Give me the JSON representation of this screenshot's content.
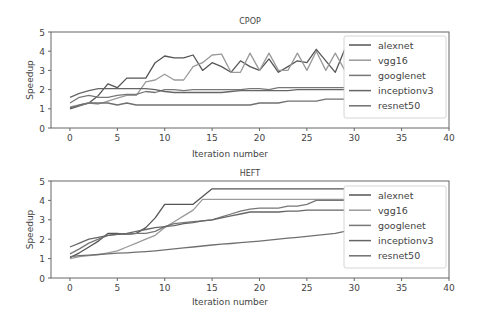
{
  "figure": {
    "width": 480,
    "height": 328
  },
  "chart_data": [
    {
      "type": "line",
      "title": "CPOP",
      "xlabel": "Iteration number",
      "ylabel": "Speedup",
      "xlim": [
        -2,
        40
      ],
      "ylim": [
        0,
        5
      ],
      "xticks": [
        0,
        5,
        10,
        15,
        20,
        25,
        30,
        35,
        40
      ],
      "yticks": [
        0,
        1,
        2,
        3,
        4,
        5
      ],
      "grid": false,
      "legend_position": "right, inside axes",
      "x": [
        0,
        1,
        2,
        3,
        4,
        5,
        6,
        7,
        8,
        9,
        10,
        11,
        12,
        13,
        14,
        15,
        16,
        17,
        18,
        19,
        20,
        21,
        22,
        23,
        24,
        25,
        26,
        27,
        28,
        29
      ],
      "series": [
        {
          "name": "alexnet",
          "color": "#555555",
          "values": [
            1.0,
            1.15,
            1.3,
            1.7,
            2.3,
            2.1,
            2.6,
            2.6,
            2.6,
            3.4,
            3.75,
            3.65,
            3.65,
            3.8,
            3.0,
            3.4,
            3.2,
            2.9,
            3.5,
            3.2,
            3.0,
            3.6,
            2.9,
            3.2,
            3.5,
            3.4,
            4.1,
            3.5,
            2.9,
            4.1
          ]
        },
        {
          "name": "vgg16",
          "color": "#9a9a9a",
          "values": [
            1.1,
            1.2,
            1.3,
            1.25,
            1.4,
            1.55,
            1.7,
            1.7,
            2.4,
            2.5,
            2.8,
            2.5,
            2.5,
            3.2,
            3.4,
            3.8,
            3.85,
            2.9,
            2.9,
            3.9,
            3.0,
            3.9,
            3.0,
            3.0,
            3.9,
            3.0,
            4.0,
            3.0,
            3.9,
            3.0
          ]
        },
        {
          "name": "googlenet",
          "color": "#777777",
          "values": [
            1.3,
            1.6,
            1.7,
            1.6,
            1.6,
            1.7,
            1.75,
            1.75,
            1.9,
            1.85,
            2.0,
            2.0,
            1.95,
            2.0,
            2.0,
            2.0,
            2.0,
            2.0,
            2.0,
            2.05,
            2.05,
            2.0,
            2.1,
            2.1,
            2.1,
            2.1,
            2.1,
            2.1,
            2.1,
            2.1
          ]
        },
        {
          "name": "inceptionv3",
          "color": "#666666",
          "values": [
            1.6,
            1.8,
            1.95,
            2.05,
            2.05,
            2.05,
            2.05,
            2.05,
            2.05,
            2.0,
            1.9,
            1.85,
            1.85,
            1.85,
            1.85,
            1.85,
            1.85,
            1.9,
            1.95,
            1.95,
            1.95,
            1.95,
            1.95,
            1.95,
            2.0,
            2.0,
            2.0,
            2.0,
            2.0,
            2.0
          ]
        },
        {
          "name": "resnet50",
          "color": "#707070",
          "values": [
            1.05,
            1.2,
            1.3,
            1.3,
            1.3,
            1.2,
            1.3,
            1.2,
            1.2,
            1.2,
            1.2,
            1.2,
            1.2,
            1.2,
            1.2,
            1.2,
            1.2,
            1.2,
            1.2,
            1.2,
            1.3,
            1.3,
            1.3,
            1.4,
            1.4,
            1.4,
            1.4,
            1.5,
            1.5,
            1.5
          ]
        }
      ]
    },
    {
      "type": "line",
      "title": "HEFT",
      "xlabel": "Iteration number",
      "ylabel": "Speedup",
      "xlim": [
        -2,
        40
      ],
      "ylim": [
        0,
        5
      ],
      "xticks": [
        0,
        5,
        10,
        15,
        20,
        25,
        30,
        35,
        40
      ],
      "yticks": [
        0,
        1,
        2,
        3,
        4,
        5
      ],
      "grid": false,
      "legend_position": "right, inside axes",
      "x": [
        0,
        1,
        2,
        3,
        4,
        5,
        6,
        7,
        8,
        9,
        10,
        11,
        12,
        13,
        14,
        15,
        16,
        17,
        18,
        19,
        20,
        21,
        22,
        23,
        24,
        25,
        26,
        27,
        28,
        29
      ],
      "series": [
        {
          "name": "alexnet",
          "color": "#555555",
          "values": [
            1.05,
            1.3,
            1.6,
            1.9,
            2.3,
            2.3,
            2.25,
            2.3,
            2.6,
            3.1,
            3.8,
            3.8,
            3.8,
            3.8,
            4.2,
            4.6,
            4.6,
            4.6,
            4.6,
            4.6,
            4.6,
            4.6,
            4.6,
            4.6,
            4.6,
            4.6,
            4.6,
            4.6,
            4.6,
            4.6
          ]
        },
        {
          "name": "vgg16",
          "color": "#9a9a9a",
          "values": [
            1.0,
            1.1,
            1.15,
            1.2,
            1.3,
            1.4,
            1.6,
            1.8,
            2.0,
            2.2,
            2.6,
            2.9,
            3.2,
            3.5,
            4.05,
            4.05,
            4.05,
            4.05,
            4.05,
            4.05,
            4.05,
            4.05,
            4.05,
            4.05,
            4.05,
            4.05,
            4.05,
            4.05,
            4.05,
            4.05
          ]
        },
        {
          "name": "googlenet",
          "color": "#777777",
          "values": [
            1.25,
            1.5,
            1.8,
            2.0,
            2.2,
            2.25,
            2.25,
            2.3,
            2.3,
            2.4,
            2.65,
            2.8,
            2.85,
            2.9,
            2.95,
            3.0,
            3.15,
            3.3,
            3.45,
            3.55,
            3.6,
            3.6,
            3.6,
            3.7,
            3.7,
            3.8,
            4.0,
            4.0,
            4.0,
            4.0
          ]
        },
        {
          "name": "inceptionv3",
          "color": "#666666",
          "values": [
            1.6,
            1.8,
            2.0,
            2.1,
            2.2,
            2.25,
            2.3,
            2.4,
            2.5,
            2.6,
            2.65,
            2.7,
            2.8,
            2.85,
            2.95,
            3.0,
            3.1,
            3.2,
            3.3,
            3.4,
            3.4,
            3.4,
            3.4,
            3.45,
            3.45,
            3.5,
            3.5,
            3.5,
            3.5,
            3.5
          ]
        },
        {
          "name": "resnet50",
          "color": "#707070",
          "values": [
            1.1,
            1.15,
            1.18,
            1.21,
            1.25,
            1.28,
            1.3,
            1.33,
            1.36,
            1.4,
            1.45,
            1.5,
            1.55,
            1.6,
            1.65,
            1.7,
            1.75,
            1.78,
            1.82,
            1.86,
            1.9,
            1.95,
            2.0,
            2.05,
            2.1,
            2.15,
            2.2,
            2.25,
            2.3,
            2.4
          ]
        }
      ]
    }
  ],
  "plots": [
    {
      "title": "CPOP",
      "xlabel": "Iteration number",
      "ylabel": "Speedup",
      "legend": [
        "alexnet",
        "vgg16",
        "googlenet",
        "inceptionv3",
        "resnet50"
      ]
    },
    {
      "title": "HEFT",
      "xlabel": "Iteration number",
      "ylabel": "Speedup",
      "legend": [
        "alexnet",
        "vgg16",
        "googlenet",
        "inceptionv3",
        "resnet50"
      ]
    }
  ]
}
